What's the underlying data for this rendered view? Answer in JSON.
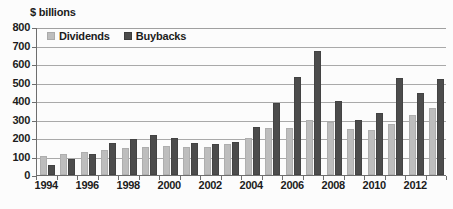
{
  "chart_data": {
    "type": "bar",
    "title": "",
    "ylabel": "$ billions",
    "xlabel": "",
    "ylim": [
      0,
      800
    ],
    "ytick_step": 100,
    "yticks": [
      0,
      100,
      200,
      300,
      400,
      500,
      600,
      700,
      800
    ],
    "grid": true,
    "legend_position": "top-left",
    "categories": [
      "1994",
      "1995",
      "1996",
      "1997",
      "1998",
      "1999",
      "2000",
      "2001",
      "2002",
      "2003",
      "2004",
      "2005",
      "2006",
      "2007",
      "2008",
      "2009",
      "2010",
      "2011",
      "2012",
      "2013"
    ],
    "visible_xtick_labels": [
      "1994",
      "1996",
      "1998",
      "2000",
      "2002",
      "2004",
      "2006",
      "2008",
      "2010",
      "2012"
    ],
    "series": [
      {
        "name": "Dividends",
        "color": "#bdbdbd",
        "values": [
          105,
          112,
          122,
          135,
          144,
          154,
          155,
          152,
          154,
          170,
          198,
          256,
          256,
          300,
          285,
          250,
          246,
          277,
          327,
          362
        ]
      },
      {
        "name": "Buybacks",
        "color": "#4c4c4c",
        "values": [
          55,
          88,
          115,
          172,
          197,
          214,
          199,
          171,
          167,
          177,
          257,
          390,
          530,
          670,
          398,
          299,
          337,
          522,
          445,
          519
        ]
      }
    ]
  },
  "axis": {
    "unit_label": "$ billions"
  },
  "legend": {
    "items": [
      {
        "label": "Dividends",
        "color": "#bdbdbd"
      },
      {
        "label": "Buybacks",
        "color": "#4c4c4c"
      }
    ]
  },
  "footer": {
    "clipped_text": ""
  }
}
